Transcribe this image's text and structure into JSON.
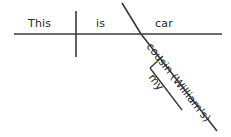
{
  "diagram": {
    "type": "reed-kellogg-sentence-diagram",
    "background_color": "#ffffff",
    "line_color": "#3a3a3a",
    "text_color": "#2b2b2b",
    "baseline_words": [
      {
        "id": "subject",
        "text": "This"
      },
      {
        "id": "linking-verb",
        "text": "is"
      },
      {
        "id": "predicate-nominative",
        "text": "car"
      }
    ],
    "modifier_words": [
      {
        "id": "possessive-modifier",
        "text": "cousin (William's)"
      },
      {
        "id": "determiner-modifier",
        "text": "my"
      }
    ],
    "lines": [
      {
        "id": "baseline",
        "x1": 14,
        "y1": 34,
        "x2": 222,
        "y2": 34
      },
      {
        "id": "subject-verb-divider",
        "x1": 76,
        "y1": 11,
        "x2": 76,
        "y2": 57
      },
      {
        "id": "predicate-slant",
        "x1": 122,
        "y1": 3,
        "x2": 141,
        "y2": 34
      },
      {
        "id": "modifier-diagonal",
        "x1": 141,
        "y1": 34,
        "x2": 217,
        "y2": 131
      },
      {
        "id": "sub-modifier-connector",
        "x1": 163,
        "y1": 56,
        "x2": 150,
        "y2": 68
      },
      {
        "id": "sub-modifier-diagonal",
        "x1": 150,
        "y1": 68,
        "x2": 182,
        "y2": 110
      }
    ]
  }
}
